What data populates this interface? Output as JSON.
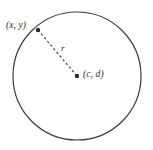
{
  "figure": {
    "type": "geometry-diagram",
    "background_color": "#ffffff",
    "stroke_color": "#3a3a3a",
    "label_color": "#2b2b2b",
    "width": 153,
    "height": 150
  },
  "circle": {
    "center_x": 77,
    "center_y": 76,
    "radius": 64,
    "stroke_width": 1.2,
    "fill": "none"
  },
  "points": [
    {
      "id": "point-xy",
      "label": "(x, y)",
      "x": 38,
      "y": 30,
      "marker_radius": 2.2,
      "label_x": 6,
      "label_y": 21
    },
    {
      "id": "point-cd",
      "label": "(c, d)",
      "x": 77,
      "y": 76,
      "marker_radius": 2.2,
      "label_x": 83,
      "label_y": 70
    }
  ],
  "radius_segment": {
    "label": "r",
    "label_x": 61,
    "label_y": 44,
    "from_x": 38,
    "from_y": 30,
    "to_x": 77,
    "to_y": 76,
    "dash_pattern": "2.4 2.4",
    "stroke_width": 1.1
  }
}
